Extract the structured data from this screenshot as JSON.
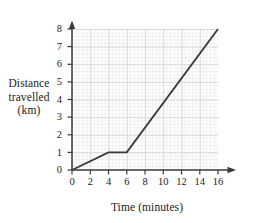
{
  "chart_data": {
    "type": "line",
    "title": "",
    "xlabel": "Time (minutes)",
    "ylabel": "Distance travelled (km)",
    "ylabel_lines": [
      "Distance",
      "travelled",
      "(km)"
    ],
    "xlim": [
      0,
      16
    ],
    "ylim": [
      0,
      8
    ],
    "xticks": [
      0,
      2,
      4,
      6,
      8,
      10,
      12,
      14,
      16
    ],
    "xtick_labels": [
      "0",
      "2",
      "4",
      "6",
      "8",
      "10",
      "12",
      "14",
      "16"
    ],
    "yticks": [
      0,
      1,
      2,
      3,
      4,
      5,
      6,
      7,
      8
    ],
    "ytick_labels": [
      "0",
      "1",
      "2",
      "3",
      "4",
      "5",
      "6",
      "7",
      "8"
    ],
    "grid": true,
    "grid_major_step_x": 2,
    "grid_major_step_y": 1,
    "grid_minor_divisions": 5,
    "legend": null,
    "series": [
      {
        "name": "Journey",
        "color": "#3a3a3a",
        "points": [
          {
            "x": 0,
            "y": 0
          },
          {
            "x": 4,
            "y": 1
          },
          {
            "x": 6,
            "y": 1
          },
          {
            "x": 16,
            "y": 8
          }
        ]
      }
    ],
    "colors": {
      "line": "#3a3a3a",
      "axis": "#3a3a3a",
      "grid_major": "#d9d9d9",
      "grid_minor": "#efefef",
      "background": "#ffffff",
      "text": "#1b1b1b"
    }
  }
}
